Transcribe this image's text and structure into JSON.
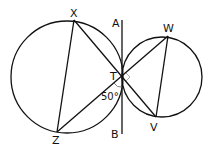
{
  "diagram": {
    "type": "geometry-two-tangent-circles",
    "labels": {
      "X": "X",
      "Z": "Z",
      "A": "A",
      "B": "B",
      "T": "T",
      "W": "W",
      "V": "V",
      "angle": "50°"
    },
    "points": {
      "X": [
        74,
        20
      ],
      "Z": [
        57,
        132
      ],
      "T": [
        122,
        76
      ],
      "W": [
        168,
        36
      ],
      "V": [
        156,
        117
      ],
      "A": [
        122,
        20
      ],
      "B": [
        122,
        134
      ]
    },
    "circles": [
      {
        "name": "left-circle",
        "cx": 67,
        "cy": 77,
        "r": 56
      },
      {
        "name": "right-circle",
        "cx": 162,
        "cy": 77,
        "r": 40
      }
    ],
    "segments": [
      "XZ",
      "XV",
      "ZW",
      "WV",
      "AB"
    ],
    "angle_marks": [
      {
        "at": "T",
        "between": [
          "TB",
          "TZ"
        ],
        "value": "50°"
      },
      {
        "at": "T",
        "between": [
          "TW",
          "TV"
        ],
        "type": "right-angle"
      }
    ],
    "stroke_color": "#111111"
  }
}
